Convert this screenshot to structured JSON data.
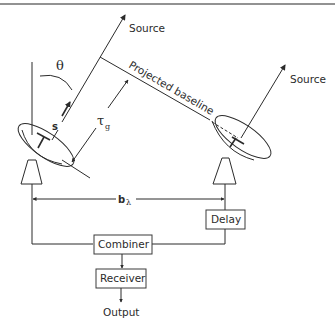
{
  "diagram": {
    "type": "two-element radio interferometer",
    "labels": {
      "source_left": "Source",
      "source_right": "Source",
      "theta": "θ",
      "s_vector": "s",
      "tau": "τ",
      "tau_sub": "g",
      "projected_baseline": "Projected baseline",
      "baseline": "b",
      "baseline_sub": "λ"
    },
    "blocks": {
      "delay": "Delay",
      "combiner": "Combiner",
      "receiver": "Receiver",
      "output": "Output"
    },
    "colors": {
      "line": "#2b2b2b",
      "background": "#ffffff",
      "top_rule": "#6e6e6e"
    }
  }
}
